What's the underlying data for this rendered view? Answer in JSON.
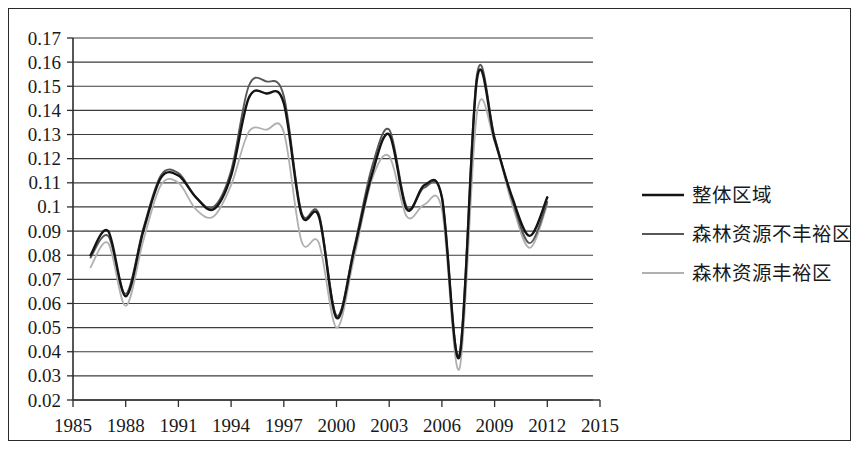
{
  "chart_data": {
    "type": "line",
    "title": "",
    "xlabel": "",
    "ylabel": "",
    "xlim": [
      1985,
      2015
    ],
    "ylim": [
      0.02,
      0.17
    ],
    "grid": true,
    "legend_position": "right",
    "x_ticks": [
      "1985",
      "1988",
      "1991",
      "1994",
      "1997",
      "2000",
      "2003",
      "2006",
      "2009",
      "2012",
      "2015"
    ],
    "y_ticks": [
      "0.17",
      "0.16",
      "0.15",
      "0.14",
      "0.13",
      "0.12",
      "0.11",
      "0.1",
      "0.09",
      "0.08",
      "0.07",
      "0.06",
      "0.05",
      "0.04",
      "0.03",
      "0.02"
    ],
    "x": [
      1986,
      1987,
      1988,
      1989,
      1990,
      1991,
      1992,
      1993,
      1994,
      1995,
      1996,
      1997,
      1998,
      1999,
      2000,
      2001,
      2002,
      2003,
      2004,
      2005,
      2006,
      2007,
      2008,
      2009,
      2010,
      2011,
      2012
    ],
    "series": [
      {
        "name": "整体区域",
        "color": "#141414",
        "width": 2.4,
        "dash": "none",
        "values": [
          0.08,
          0.09,
          0.063,
          0.09,
          0.112,
          0.113,
          0.104,
          0.099,
          0.113,
          0.145,
          0.147,
          0.143,
          0.097,
          0.096,
          0.054,
          0.082,
          0.113,
          0.13,
          0.099,
          0.109,
          0.104,
          0.038,
          0.153,
          0.128,
          0.104,
          0.088,
          0.104
        ]
      },
      {
        "name": "森林资源不丰裕区",
        "color": "#585858",
        "width": 1.9,
        "dash": "none",
        "values": [
          0.079,
          0.088,
          0.064,
          0.091,
          0.113,
          0.114,
          0.104,
          0.1,
          0.115,
          0.15,
          0.152,
          0.146,
          0.098,
          0.097,
          0.055,
          0.083,
          0.116,
          0.132,
          0.1,
          0.108,
          0.104,
          0.039,
          0.155,
          0.129,
          0.103,
          0.085,
          0.102
        ]
      },
      {
        "name": "森林资源丰裕区",
        "color": "#b0b0b0",
        "width": 1.8,
        "dash": "none",
        "values": [
          0.075,
          0.085,
          0.059,
          0.086,
          0.109,
          0.11,
          0.099,
          0.096,
          0.109,
          0.131,
          0.132,
          0.131,
          0.086,
          0.085,
          0.05,
          0.079,
          0.111,
          0.121,
          0.096,
          0.101,
          0.099,
          0.033,
          0.139,
          0.127,
          0.101,
          0.083,
          0.101
        ]
      }
    ]
  },
  "legend": {
    "entries": [
      {
        "label": "整体区域",
        "swatch": "solid-black-line"
      },
      {
        "label": "森林资源不丰裕区",
        "swatch": "solid-gray-line"
      },
      {
        "label": "森林资源丰裕区",
        "swatch": "solid-lightgray-line"
      }
    ]
  }
}
